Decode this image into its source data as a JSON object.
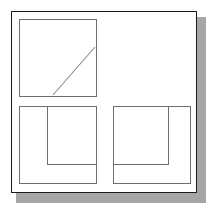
{
  "figure": {
    "canvas": {
      "width": 214,
      "height": 211
    },
    "background_color": "#ffffff",
    "panel": {
      "name": "outer-frame",
      "x": 11,
      "y": 11,
      "width": 186,
      "height": 182,
      "fill": "#ffffff",
      "border_color": "#1a1a1a",
      "border_width": 1.5
    },
    "shadow": {
      "name": "drop-shadow",
      "x": 16,
      "y": 17,
      "width": 190,
      "height": 186,
      "color": "#a6a6a6"
    },
    "stroke_color": "#6e6e6e",
    "diagonal_color": "#8a8a8a",
    "shapes": [
      {
        "name": "top-left-square",
        "type": "rect",
        "x": 19,
        "y": 19,
        "width": 77,
        "height": 77,
        "label": "square-with-diagonal"
      },
      {
        "name": "diagonal-line",
        "type": "line",
        "x1": 53,
        "y1": 95,
        "x2": 95,
        "y2": 47,
        "label": "diagonal"
      },
      {
        "name": "bottom-left-outer-square",
        "type": "rect",
        "x": 19,
        "y": 106,
        "width": 77,
        "height": 77,
        "label": "outer-square"
      },
      {
        "name": "bottom-left-inner-square",
        "type": "rect",
        "x": 47,
        "y": 106,
        "width": 49,
        "height": 58,
        "label": "inner-square"
      },
      {
        "name": "bottom-right-outer-square",
        "type": "rect",
        "x": 113,
        "y": 106,
        "width": 77,
        "height": 77,
        "label": "outer-square"
      },
      {
        "name": "bottom-right-inner-square",
        "type": "rect",
        "x": 113,
        "y": 106,
        "width": 55,
        "height": 58,
        "label": "inner-square"
      }
    ]
  }
}
